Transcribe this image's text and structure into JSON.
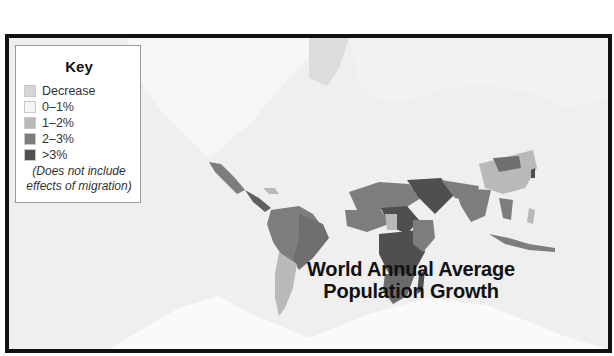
{
  "caption": {
    "number": "",
    "text": "World Geography map on the same page"
  },
  "map": {
    "title_line1": "World Annual Average",
    "title_line2": "Population Growth",
    "legend": {
      "title": "Key",
      "items": [
        {
          "label": "Decrease",
          "color": "#d6d6d6"
        },
        {
          "label": "0–1%",
          "color": "#f4f4f4"
        },
        {
          "label": "1–2%",
          "color": "#b9b9b9"
        },
        {
          "label": "2–3%",
          "color": "#7d7d7d"
        },
        {
          "label": ">3%",
          "color": "#4f4f4f"
        }
      ],
      "note_line1": "(Does not include",
      "note_line2": "effects of migration)"
    },
    "colors": {
      "frame": "#111111",
      "background": "#efefef",
      "land_low": "#f4f4f4",
      "decrease": "#d6d6d6",
      "growth_1_2": "#b9b9b9",
      "growth_2_3": "#7d7d7d",
      "growth_over_3": "#4f4f4f"
    }
  }
}
